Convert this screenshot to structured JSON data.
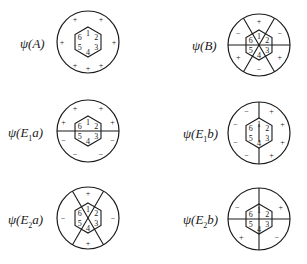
{
  "figure": {
    "style": {
      "stroke": "#1a1a1a",
      "background": "#ffffff"
    },
    "panels": [
      {
        "id": "A",
        "label_prefix": "ψ(",
        "label_main": "A",
        "label_sub": "",
        "label_tail": ")",
        "center": [
          88,
          42
        ],
        "label_pos": [
          20,
          36
        ],
        "nodal_lines": "none",
        "atoms": [
          "1",
          "2",
          "3",
          "4",
          "5",
          "6"
        ],
        "signs": [
          {
            "t": "+",
            "a": -60,
            "r": 26
          },
          {
            "t": "+",
            "a": -120,
            "r": 26
          },
          {
            "t": "+",
            "a": 0,
            "r": 26
          },
          {
            "t": "+",
            "a": 180,
            "r": 26
          },
          {
            "t": "+",
            "a": 60,
            "r": 26
          },
          {
            "t": "+",
            "a": 120,
            "r": 26
          },
          {
            "t": "+",
            "a": 90,
            "r": 26
          }
        ]
      },
      {
        "id": "B",
        "label_prefix": "ψ(",
        "label_main": "B",
        "label_sub": "",
        "label_tail": ")",
        "center": [
          259,
          45
        ],
        "label_pos": [
          192,
          38
        ],
        "nodal_lines": "three-diagonals",
        "atoms": [
          "1",
          "2",
          "3",
          "4",
          "5",
          "6"
        ],
        "signs": [
          {
            "t": "+",
            "a": -90,
            "r": 24
          },
          {
            "t": "−",
            "a": -30,
            "r": 24
          },
          {
            "t": "+",
            "a": 30,
            "r": 24
          },
          {
            "t": "−",
            "a": 90,
            "r": 24
          },
          {
            "t": "+",
            "a": 150,
            "r": 24
          },
          {
            "t": "−",
            "a": -150,
            "r": 24
          }
        ]
      },
      {
        "id": "E1a",
        "label_prefix": "ψ(",
        "label_main": "E",
        "label_sub": "1",
        "label_tail": "a)",
        "center": [
          88,
          131
        ],
        "label_pos": [
          8,
          125
        ],
        "nodal_lines": "horizontal",
        "atoms": [
          "1",
          "2",
          "3",
          "4",
          "5",
          "6"
        ],
        "signs": [
          {
            "t": "+",
            "a": -60,
            "r": 26
          },
          {
            "t": "+",
            "a": -120,
            "r": 26
          },
          {
            "t": "+",
            "a": -20,
            "r": 26
          },
          {
            "t": "+",
            "a": -160,
            "r": 26
          },
          {
            "t": "−",
            "a": 20,
            "r": 26
          },
          {
            "t": "−",
            "a": 160,
            "r": 26
          },
          {
            "t": "−",
            "a": 60,
            "r": 26
          },
          {
            "t": "−",
            "a": 120,
            "r": 26
          }
        ]
      },
      {
        "id": "E1b",
        "label_prefix": "ψ(",
        "label_main": "E",
        "label_sub": "1",
        "label_tail": "b)",
        "center": [
          259,
          133
        ],
        "label_pos": [
          183,
          126
        ],
        "nodal_lines": "vertical",
        "atoms": [
          "1",
          "2",
          "3",
          "4",
          "5",
          "6"
        ],
        "signs": [
          {
            "t": "−",
            "a": -120,
            "r": 25
          },
          {
            "t": "+",
            "a": -60,
            "r": 25
          },
          {
            "t": "−",
            "a": -160,
            "r": 25
          },
          {
            "t": "+",
            "a": -20,
            "r": 25
          },
          {
            "t": "−",
            "a": 160,
            "r": 25
          },
          {
            "t": "+",
            "a": 20,
            "r": 25
          },
          {
            "t": "−",
            "a": 120,
            "r": 25
          },
          {
            "t": "+",
            "a": 60,
            "r": 25
          }
        ]
      },
      {
        "id": "E2a",
        "label_prefix": "ψ(",
        "label_main": "E",
        "label_sub": "2",
        "label_tail": "a)",
        "center": [
          88,
          218
        ],
        "label_pos": [
          8,
          212
        ],
        "nodal_lines": "x-cross",
        "atoms": [
          "1",
          "2",
          "3",
          "4",
          "5",
          "6"
        ],
        "signs": [
          {
            "t": "+",
            "a": -90,
            "r": 25
          },
          {
            "t": "−",
            "a": 0,
            "r": 25
          },
          {
            "t": "+",
            "a": 90,
            "r": 25
          },
          {
            "t": "−",
            "a": 180,
            "r": 25
          }
        ]
      },
      {
        "id": "E2b",
        "label_prefix": "ψ(",
        "label_main": "E",
        "label_sub": "2",
        "label_tail": "b)",
        "center": [
          259,
          219
        ],
        "label_pos": [
          183,
          212
        ],
        "nodal_lines": "plus-cross",
        "atoms": [
          "1",
          "2",
          "3",
          "4",
          "5",
          "6"
        ],
        "signs": [
          {
            "t": "−",
            "a": -150,
            "r": 25
          },
          {
            "t": "+",
            "a": -30,
            "r": 25
          },
          {
            "t": "+",
            "a": 135,
            "r": 25
          },
          {
            "t": "−",
            "a": 45,
            "r": 25
          }
        ]
      }
    ]
  }
}
